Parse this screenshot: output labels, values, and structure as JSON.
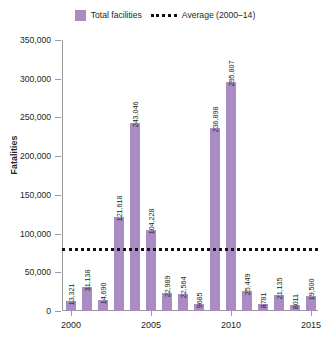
{
  "legend": {
    "series_label": "Total facilities",
    "average_label": "Average (2000–14)",
    "swatch_name": "purple-square-swatch",
    "dash_name": "dotted-line-swatch"
  },
  "axes": {
    "ylabel": "Fatalities",
    "yticks": [
      "0",
      "50,000",
      "100,000",
      "150,000",
      "200,000",
      "250,000",
      "300,000",
      "350,000"
    ],
    "xticks": [
      "2000",
      "2005",
      "2010",
      "2015"
    ]
  },
  "chart_data": {
    "type": "bar",
    "title": "",
    "xlabel": "",
    "ylabel": "Fatalities",
    "ylim": [
      0,
      350000
    ],
    "ytick_values": [
      0,
      50000,
      100000,
      150000,
      200000,
      250000,
      300000,
      350000
    ],
    "ytick_labels": [
      "0",
      "50,000",
      "100,000",
      "150,000",
      "200,000",
      "250,000",
      "300,000",
      "350,000"
    ],
    "xtick_labels": [
      "2000",
      "2005",
      "2010",
      "2015"
    ],
    "grid": false,
    "legend_position": "top-center",
    "bar_color": "#a98cc4",
    "categories": [
      "2000",
      "2001",
      "2002",
      "2003",
      "2004",
      "2005",
      "2006",
      "2007",
      "2008",
      "2009",
      "2010",
      "2011",
      "2012",
      "2013",
      "2014",
      "2015"
    ],
    "values": [
      13321,
      31138,
      14690,
      121618,
      243046,
      104228,
      22989,
      22564,
      9685,
      236898,
      295807,
      25449,
      8781,
      21135,
      8011,
      19500
    ],
    "value_labels": [
      "13,321",
      "31,138",
      "14,690",
      "121,618",
      "243,046",
      "104,228",
      "22,989",
      "22,564",
      "9685",
      "236,898",
      "295,807",
      "25,449",
      "8781",
      "21,135",
      "8011",
      "19,500"
    ],
    "series": [
      {
        "name": "Total facilities",
        "values": [
          13321,
          31138,
          14690,
          121618,
          243046,
          104228,
          22989,
          22564,
          9685,
          236898,
          295807,
          25449,
          8781,
          21135,
          8011,
          19500
        ]
      }
    ],
    "annotations": [
      {
        "type": "hline",
        "name": "Average (2000–14)",
        "value": 82000,
        "style": "dotted",
        "color": "#111111"
      }
    ]
  }
}
